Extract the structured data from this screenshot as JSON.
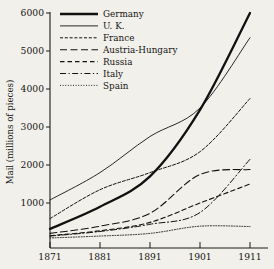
{
  "chart_data": {
    "type": "line",
    "title": "",
    "xlabel": "",
    "ylabel": "Mail (millions of pieces)",
    "x": [
      1871,
      1881,
      1891,
      1901,
      1911
    ],
    "xticklabels": [
      "1871",
      "1881",
      "1891",
      "1901",
      "1911"
    ],
    "yticks": [
      1000,
      2000,
      3000,
      4000,
      5000,
      6000
    ],
    "yticklabels": [
      "1000",
      "2000",
      "3000",
      "4000",
      "5000",
      "6000"
    ],
    "xlim": [
      1871,
      1911
    ],
    "ylim": [
      0,
      6000
    ],
    "grid": false,
    "legend_position": "top-left",
    "series": [
      {
        "name": "Germany",
        "style": "solid-thick",
        "values": [
          320,
          900,
          1700,
          3450,
          6000
        ]
      },
      {
        "name": "U. K.",
        "style": "solid-thin",
        "values": [
          1080,
          1800,
          2750,
          3500,
          5350
        ]
      },
      {
        "name": "France",
        "style": "dotted-dash",
        "values": [
          590,
          1350,
          1800,
          2350,
          3750
        ]
      },
      {
        "name": "Austria-Hungary",
        "style": "long-dash",
        "values": [
          200,
          390,
          730,
          1750,
          1880
        ]
      },
      {
        "name": "Russia",
        "style": "medium-dash",
        "values": [
          140,
          270,
          490,
          1000,
          1500
        ]
      },
      {
        "name": "Italy",
        "style": "dash-dot",
        "values": [
          130,
          250,
          440,
          750,
          2150
        ]
      },
      {
        "name": "Spain",
        "style": "fine-dotted",
        "values": [
          80,
          130,
          200,
          390,
          380
        ]
      }
    ]
  },
  "legend": {
    "entries": [
      {
        "label": "Germany"
      },
      {
        "label": "U. K."
      },
      {
        "label": "France"
      },
      {
        "label": "Austria-Hungary"
      },
      {
        "label": "Russia"
      },
      {
        "label": "Italy"
      },
      {
        "label": "Spain"
      }
    ]
  },
  "colors": {
    "background": "#f2f0ea",
    "ink": "#111111",
    "axis": "#1a1a1a"
  }
}
